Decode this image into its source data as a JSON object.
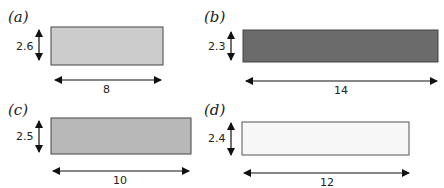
{
  "figures": [
    {
      "label": "(a)",
      "height_value": "2.6",
      "width_value": "8",
      "fill": "#cccccc"
    },
    {
      "label": "(b)",
      "height_value": "2.3",
      "width_value": "14",
      "fill": "#6b6b6b"
    },
    {
      "label": "(c)",
      "height_value": "2.5",
      "width_value": "10",
      "fill": "#b8b8b8"
    },
    {
      "label": "(d)",
      "height_value": "2.4",
      "width_value": "12",
      "fill": "#f7f7f7"
    }
  ],
  "colors": {
    "stroke": "#444444",
    "arrow": "#111111"
  }
}
